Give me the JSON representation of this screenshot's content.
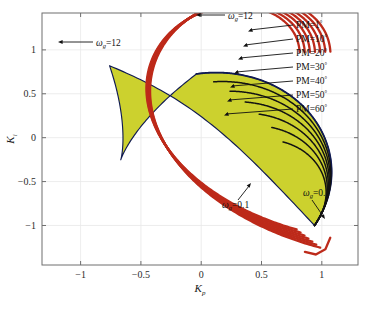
{
  "chart_data": {
    "type": "line",
    "title": "",
    "xlabel": "K_p",
    "ylabel": "K_i",
    "xlabel_main": "K",
    "xlabel_sub": "p",
    "ylabel_main": "K",
    "ylabel_sub": "i",
    "xlim": [
      -1.32,
      1.3
    ],
    "ylim": [
      -1.45,
      1.42
    ],
    "xticks": [
      -1,
      -0.5,
      0,
      0.5,
      1
    ],
    "xticklabels": [
      "−1",
      "−0.5",
      "0",
      "0.5",
      "1"
    ],
    "yticks": [
      -1,
      -0.5,
      0,
      0.5,
      1
    ],
    "yticklabels": [
      "−1",
      "−0.5",
      "0",
      "0.5",
      "1"
    ],
    "grid": true,
    "legend": "none",
    "fill_color": "#ccd12e",
    "boundary_color": "#101a52",
    "curve_color": "#bd2a1a",
    "frame_color": "#6f6f6f",
    "grid_color": "#e9e9e9",
    "series": [
      {
        "name": "PM=1°",
        "color": "#101a52",
        "pm_deg": 1
      },
      {
        "name": "PM=10°",
        "color": "#0e1020",
        "pm_deg": 10
      },
      {
        "name": "PM=20°",
        "color": "#0e1020",
        "pm_deg": 20
      },
      {
        "name": "PM=30°",
        "color": "#0e1020",
        "pm_deg": 30
      },
      {
        "name": "PM=40°",
        "color": "#0e1020",
        "pm_deg": 40
      },
      {
        "name": "PM=50°",
        "color": "#0e1020",
        "pm_deg": 50
      },
      {
        "name": "PM=60°",
        "color": "#0e1020",
        "pm_deg": 60
      }
    ],
    "red_family": {
      "name": "constant-gain-crossover loci",
      "color": "#bd2a1a",
      "count": 7,
      "converge_point": [
        -0.8,
        0.94
      ]
    },
    "annotations": [
      {
        "id": "wg12-left",
        "text": "ωg=12",
        "symbol": "ω",
        "sub": "g",
        "value": "=12",
        "x": 0.255,
        "y": 0.145
      },
      {
        "id": "wg12-top",
        "text": "ωg=12",
        "symbol": "ω",
        "sub": "g",
        "value": "=12",
        "x": 0.615,
        "y": 0.055
      },
      {
        "id": "wg01-mid",
        "text": "ωg=0.1",
        "symbol": "ω",
        "sub": "g",
        "value": "=0.1",
        "x": 0.445,
        "y": 0.645
      },
      {
        "id": "wg01-right",
        "text": "ωg=0.1",
        "symbol": "ω",
        "sub": "g",
        "value": "=0.1",
        "x": 0.845,
        "y": 0.61
      }
    ],
    "pm_labels": [
      {
        "label": "PM=1°",
        "prefix": "PM=1",
        "unit": "°"
      },
      {
        "label": "PM=10°",
        "prefix": "PM=10",
        "unit": "°"
      },
      {
        "label": "PM=20°",
        "prefix": "PM=20",
        "unit": "°"
      },
      {
        "label": "PM=30°",
        "prefix": "PM=30",
        "unit": "°"
      },
      {
        "label": "PM=40°",
        "prefix": "PM=40",
        "unit": "°"
      },
      {
        "label": "PM=50°",
        "prefix": "PM=50",
        "unit": "°"
      },
      {
        "label": "PM=60°",
        "prefix": "PM=60",
        "unit": "°"
      }
    ]
  }
}
